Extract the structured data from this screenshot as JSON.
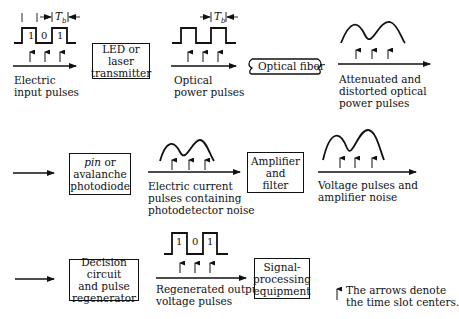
{
  "diagram": {
    "row1": {
      "input_pulses": {
        "bits": [
          "1",
          "0",
          "1"
        ],
        "period_label": "T",
        "period_sub": "b",
        "caption": [
          "Electric",
          "input pulses"
        ]
      },
      "transmitter": {
        "label": [
          "LED or laser",
          "transmitter"
        ]
      },
      "optical_pulses": {
        "period_label": "T",
        "period_sub": "b",
        "caption": [
          "Optical",
          "power pulses"
        ]
      },
      "fiber": {
        "label": "Optical fiber"
      },
      "attenuated": {
        "caption": [
          "Attenuated and",
          "distorted optical",
          "power pulses"
        ]
      }
    },
    "row2": {
      "photodiode": {
        "label_italic": "pin",
        "label_rest": " or",
        "label": [
          "avalanche",
          "photodiode"
        ]
      },
      "current_pulses": {
        "caption": [
          "Electric current",
          "pulses containing",
          "photodetector noise"
        ]
      },
      "amplifier": {
        "label": [
          "Amplifier",
          "and",
          "filter"
        ]
      },
      "voltage_pulses": {
        "caption": [
          "Voltage pulses and",
          "amplifier noise"
        ]
      }
    },
    "row3": {
      "decision": {
        "label": [
          "Decision circuit",
          "and pulse",
          "regenerator"
        ]
      },
      "regenerated": {
        "bits": [
          "1",
          "0",
          "1"
        ],
        "caption": [
          "Regenerated output",
          "voltage pulses"
        ]
      },
      "signal_processing": {
        "label": [
          "Signal-",
          "processing",
          "equipment"
        ]
      },
      "legend": {
        "text": [
          "The arrows denote",
          "the time slot centers."
        ]
      }
    }
  }
}
